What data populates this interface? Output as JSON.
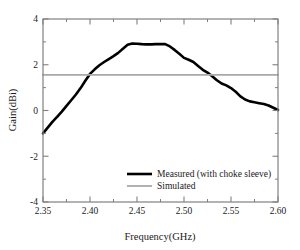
{
  "chart_data": {
    "type": "line",
    "title": "",
    "xlabel": "Frequency(GHz)",
    "ylabel": "Gain(dBi)",
    "xlim": [
      2.35,
      2.6
    ],
    "ylim": [
      -4,
      4
    ],
    "xticks": [
      2.35,
      2.4,
      2.45,
      2.5,
      2.55,
      2.6
    ],
    "xticklabels": [
      "2.35",
      "2.40",
      "2.45",
      "2.50",
      "2.55",
      "2.60"
    ],
    "yticks": [
      -4,
      -2,
      0,
      2,
      4
    ],
    "yticklabels": [
      "-4",
      "-2",
      "0",
      "2",
      "4"
    ],
    "minor_xticks": [
      2.375,
      2.425,
      2.475,
      2.525,
      2.575
    ],
    "grid": false,
    "legend_position": "lower right",
    "series": [
      {
        "name": "Measured (with choke sleeve)",
        "color": "#000000",
        "width": 2.6,
        "style": "solid",
        "x": [
          2.35,
          2.355,
          2.36,
          2.365,
          2.37,
          2.375,
          2.38,
          2.385,
          2.39,
          2.395,
          2.4,
          2.405,
          2.41,
          2.415,
          2.42,
          2.425,
          2.43,
          2.435,
          2.44,
          2.445,
          2.45,
          2.455,
          2.46,
          2.465,
          2.47,
          2.475,
          2.48,
          2.485,
          2.49,
          2.495,
          2.5,
          2.505,
          2.51,
          2.515,
          2.52,
          2.525,
          2.53,
          2.535,
          2.54,
          2.545,
          2.55,
          2.555,
          2.56,
          2.565,
          2.57,
          2.575,
          2.58,
          2.585,
          2.59,
          2.595,
          2.6
        ],
        "y": [
          -1.0,
          -0.75,
          -0.5,
          -0.28,
          -0.05,
          0.2,
          0.45,
          0.7,
          0.98,
          1.3,
          1.6,
          1.8,
          1.98,
          2.12,
          2.25,
          2.38,
          2.52,
          2.7,
          2.87,
          2.93,
          2.92,
          2.9,
          2.89,
          2.89,
          2.9,
          2.91,
          2.9,
          2.8,
          2.65,
          2.48,
          2.3,
          2.22,
          2.12,
          1.95,
          1.78,
          1.66,
          1.5,
          1.32,
          1.18,
          1.1,
          0.98,
          0.82,
          0.62,
          0.48,
          0.4,
          0.36,
          0.32,
          0.28,
          0.22,
          0.12,
          0.02
        ]
      },
      {
        "name": "Simulated",
        "color": "#a9a9a9",
        "width": 1.8,
        "style": "solid",
        "x": [
          2.35,
          2.6
        ],
        "y": [
          1.56,
          1.56
        ]
      }
    ],
    "legend": [
      {
        "label": "Measured (with choke sleeve)",
        "color": "#000000",
        "width": 2.6
      },
      {
        "label": "Simulated",
        "color": "#a9a9a9",
        "width": 1.8
      }
    ],
    "frame_color": "#808080",
    "background": "#ffffff"
  }
}
